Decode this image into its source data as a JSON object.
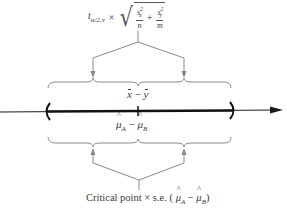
{
  "top_formula": {
    "critical_value": "t",
    "critical_subscript": "α/2,ν",
    "times": "×",
    "term1_num": "s",
    "term1_sup": "2",
    "term1_sub": "x",
    "term1_den": "n",
    "plus": "+",
    "term2_num": "s",
    "term2_sup": "2",
    "term2_sub": "y",
    "term2_den": "m",
    "radical": "√"
  },
  "difference_label": {
    "x": "x",
    "minus": " − ",
    "y": "y"
  },
  "parameter_label": {
    "mu_a": "μ",
    "sub_a": "A",
    "minus": " − ",
    "mu_b": "μ",
    "sub_b": "B"
  },
  "bottom_label": {
    "prefix": "Critical point × s.e. (",
    "mu_a": "μ",
    "sub_a": "A",
    "minus": " − ",
    "mu_b": "μ",
    "sub_b": "B",
    "suffix": ")"
  },
  "number_line": {
    "interval_left_bracket": "(",
    "interval_right_bracket": ")"
  },
  "colors": {
    "line": "#1a1a1a",
    "connector": "#8a8a8a",
    "text": "#3a3a3a"
  }
}
